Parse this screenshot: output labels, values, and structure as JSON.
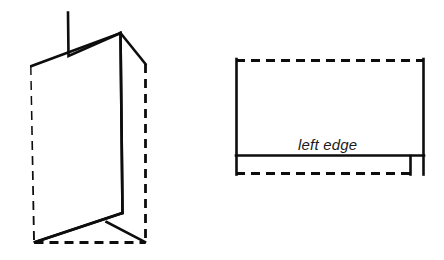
{
  "figure": {
    "background_color": "#ffffff",
    "line_color": "#0d0d0d",
    "label_color": "#1a1a1a",
    "panels": [
      {
        "name": "folded-view",
        "description": "Three-dimensional view of a sheet of paper folded vertically, shown standing up, with dashed outline indicating the flat unfolded footprint."
      },
      {
        "name": "flat-view",
        "description": "Flat overhead view of the same sheet, rectangle with a solid horizontal crease line near the bottom and a small square notch at the bottom right corner."
      }
    ],
    "labels": {
      "left_edge": "left edge"
    },
    "line_styles": {
      "solid": "solid",
      "dashed": "dashed"
    }
  }
}
